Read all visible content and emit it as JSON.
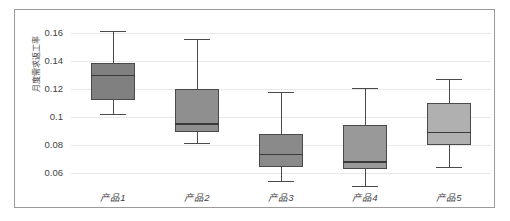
{
  "chart_data": {
    "type": "box",
    "title": "",
    "xlabel": "",
    "ylabel": "月度需求返工率",
    "ylim": [
      0.05,
      0.168
    ],
    "yticks": [
      "0.06",
      "0.08",
      "0.1",
      "0.12",
      "0.14",
      "0.16"
    ],
    "ytick_values": [
      0.06,
      0.08,
      0.1,
      0.12,
      0.14,
      0.16
    ],
    "grid": true,
    "legend": "none",
    "categories": [
      "产品1",
      "产品2",
      "产品3",
      "产品4",
      "产品5"
    ],
    "boxes": [
      {
        "category": "产品1",
        "min": 0.1021,
        "q1": 0.1123,
        "median": 0.1302,
        "q3": 0.1387,
        "max": 0.1616,
        "fill": "#808080"
      },
      {
        "category": "产品2",
        "min": 0.0818,
        "q1": 0.0893,
        "median": 0.0957,
        "q3": 0.1199,
        "max": 0.1557,
        "fill": "#8f8f8f"
      },
      {
        "category": "产品3",
        "min": 0.0545,
        "q1": 0.0641,
        "median": 0.0738,
        "q3": 0.0882,
        "max": 0.1177,
        "fill": "#8a8a8a"
      },
      {
        "category": "产品4",
        "min": 0.051,
        "q1": 0.0631,
        "median": 0.0685,
        "q3": 0.0943,
        "max": 0.1208,
        "fill": "#999999"
      },
      {
        "category": "产品5",
        "min": 0.0645,
        "q1": 0.08,
        "median": 0.0894,
        "q3": 0.1101,
        "max": 0.1275,
        "fill": "#b0b0b0"
      }
    ]
  },
  "colors": {
    "frame_border": "#9a9a9a",
    "gridline": "#e8e8e8",
    "line": "#4a4a4a",
    "text": "#3f3f3f",
    "background": "#ffffff"
  }
}
